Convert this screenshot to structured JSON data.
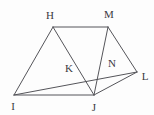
{
  "figure": {
    "type": "geometry-diagram",
    "canvas": {
      "width": 154,
      "height": 115
    },
    "colors": {
      "background": "#fdfdfd",
      "stroke": "#55555a",
      "label": "#3a3a3f"
    },
    "points": [
      {
        "id": "H",
        "label": "H",
        "x": 53,
        "y": 27,
        "label_x": 50,
        "label_y": 15,
        "kind": "vertex"
      },
      {
        "id": "M",
        "label": "M",
        "x": 108,
        "y": 27,
        "label_x": 109,
        "label_y": 14,
        "kind": "vertex"
      },
      {
        "id": "L",
        "label": "L",
        "x": 137,
        "y": 72,
        "label_x": 145,
        "label_y": 76,
        "kind": "vertex"
      },
      {
        "id": "I",
        "label": "I",
        "x": 14,
        "y": 95,
        "label_x": 13,
        "label_y": 106,
        "kind": "vertex"
      },
      {
        "id": "J",
        "label": "J",
        "x": 94,
        "y": 95,
        "label_x": 94,
        "label_y": 107,
        "kind": "vertex"
      },
      {
        "id": "K",
        "label": "K",
        "x": 77,
        "y": 72,
        "label_x": 69,
        "label_y": 68,
        "kind": "intersection"
      },
      {
        "id": "N",
        "label": "N",
        "x": 107,
        "y": 72,
        "label_x": 112,
        "label_y": 63,
        "kind": "intersection"
      }
    ],
    "edges": [
      {
        "id": "HM",
        "from": "H",
        "to": "M"
      },
      {
        "id": "HI",
        "from": "H",
        "to": "I"
      },
      {
        "id": "HJ",
        "from": "H",
        "to": "J"
      },
      {
        "id": "IJ",
        "from": "I",
        "to": "J"
      },
      {
        "id": "IL",
        "from": "I",
        "to": "L"
      },
      {
        "id": "JL",
        "from": "J",
        "to": "L"
      },
      {
        "id": "MJ",
        "from": "M",
        "to": "J"
      },
      {
        "id": "ML",
        "from": "M",
        "to": "L"
      }
    ]
  }
}
